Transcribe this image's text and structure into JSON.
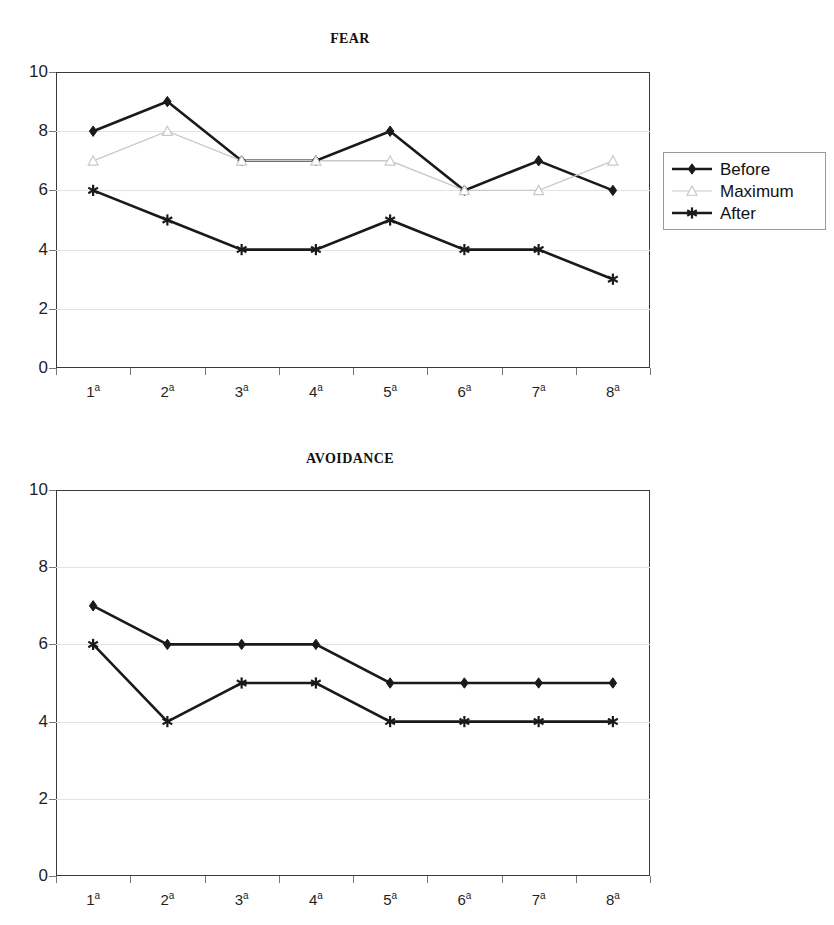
{
  "page": {
    "background_color": "#ffffff",
    "width": 834,
    "height": 925
  },
  "colors": {
    "series_dark": "#1a1a1a",
    "series_light": "#c9c9c9",
    "axis": "#3a3a3a",
    "grid": "#e2e2e2",
    "text": "#1a1a1a"
  },
  "charts": [
    {
      "id": "fear",
      "title": "FEAR",
      "legend_position": "right",
      "legend_items": [
        {
          "label": "Before",
          "marker": "filled-diamond",
          "color": "#1a1a1a"
        },
        {
          "label": "Maximum",
          "marker": "open-triangle",
          "color": "#c9c9c9"
        },
        {
          "label": "After",
          "marker": "asterisk",
          "color": "#1a1a1a"
        }
      ]
    },
    {
      "id": "avoidance",
      "title": "AVOIDANCE",
      "legend_position": "right",
      "legend_items": [
        {
          "label": "Before",
          "marker": "filled-diamond",
          "color": "#1a1a1a"
        },
        {
          "label": "After",
          "marker": "asterisk",
          "color": "#1a1a1a"
        }
      ]
    }
  ],
  "axes": {
    "y_ticks": [
      "0",
      "2",
      "4",
      "6",
      "8",
      "10"
    ],
    "x_tick_base": [
      "1",
      "2",
      "3",
      "4",
      "5",
      "6",
      "7",
      "8"
    ],
    "x_tick_sup": "a",
    "x_tick_labels": [
      "1a",
      "2a",
      "3a",
      "4a",
      "5a",
      "6a",
      "7a",
      "8a"
    ]
  },
  "chart_data": [
    {
      "type": "line",
      "title": "FEAR",
      "xlabel": "",
      "ylabel": "",
      "categories": [
        "1ª",
        "2ª",
        "3ª",
        "4ª",
        "5ª",
        "6ª",
        "7ª",
        "8ª"
      ],
      "ylim": [
        0,
        10
      ],
      "yticks": [
        0,
        2,
        4,
        6,
        8,
        10
      ],
      "grid": true,
      "legend": [
        "Before",
        "Maximum",
        "After"
      ],
      "legend_position": "right",
      "series": [
        {
          "name": "Before",
          "values": [
            8,
            9,
            7,
            7,
            8,
            6,
            7,
            6
          ],
          "marker": "filled-diamond",
          "color": "#1a1a1a"
        },
        {
          "name": "Maximum",
          "values": [
            7,
            8,
            7,
            7,
            7,
            6,
            6,
            7
          ],
          "marker": "open-triangle",
          "color": "#c9c9c9"
        },
        {
          "name": "After",
          "values": [
            6,
            5,
            4,
            4,
            5,
            4,
            4,
            3
          ],
          "marker": "asterisk",
          "color": "#1a1a1a"
        }
      ]
    },
    {
      "type": "line",
      "title": "AVOIDANCE",
      "xlabel": "",
      "ylabel": "",
      "categories": [
        "1ª",
        "2ª",
        "3ª",
        "4ª",
        "5ª",
        "6ª",
        "7ª",
        "8ª"
      ],
      "ylim": [
        0,
        10
      ],
      "yticks": [
        0,
        2,
        4,
        6,
        8,
        10
      ],
      "grid": true,
      "legend": [
        "Before",
        "After"
      ],
      "legend_position": "right",
      "series": [
        {
          "name": "Before",
          "values": [
            7,
            6,
            6,
            6,
            5,
            5,
            5,
            5
          ],
          "marker": "filled-diamond",
          "color": "#1a1a1a"
        },
        {
          "name": "After",
          "values": [
            6,
            4,
            5,
            5,
            4,
            4,
            4,
            4
          ],
          "marker": "asterisk",
          "color": "#1a1a1a"
        }
      ]
    }
  ]
}
